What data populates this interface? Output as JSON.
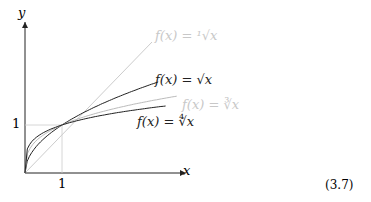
{
  "chart_data": {
    "type": "line",
    "xlabel": "x",
    "ylabel": "y",
    "x_ticks": [
      "1"
    ],
    "y_ticks": [
      "1"
    ],
    "series": [
      {
        "name": "f(x) = ¹√x",
        "color": "#c8c8c8",
        "label_pos": [
          155,
          35
        ]
      },
      {
        "name": "f(x) = √x",
        "color": "#222222",
        "label_pos": [
          155,
          78
        ]
      },
      {
        "name": "f(x) = ∛x",
        "color": "#c8c8c8",
        "label_pos": [
          180,
          104
        ]
      },
      {
        "name": "f(x) = ∜x",
        "color": "#222222",
        "label_pos": [
          135,
          120
        ]
      }
    ]
  },
  "labels": {
    "x": "x",
    "y": "y",
    "one_x": "1",
    "one_y": "1",
    "eq": "(3.7)"
  }
}
